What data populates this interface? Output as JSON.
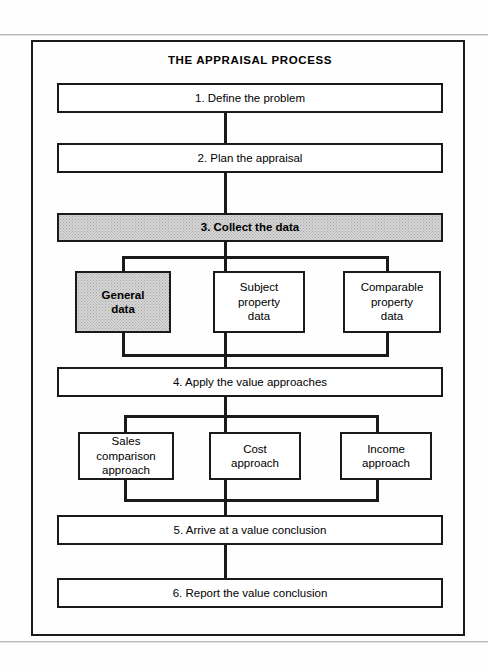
{
  "figure": {
    "title": "THE APPRAISAL PROCESS",
    "colors": {
      "ink": "#1a1a1a",
      "paper": "#fefefe",
      "highlight_fill": "#d5d5d5"
    }
  },
  "steps": [
    {
      "id": "step1",
      "label": "1. Define the problem",
      "highlighted": false
    },
    {
      "id": "step2",
      "label": "2.  Plan the appraisal",
      "highlighted": false
    },
    {
      "id": "step3",
      "label": "3.  Collect the data",
      "highlighted": true
    },
    {
      "id": "step4",
      "label": "4.  Apply the value approaches",
      "highlighted": false
    },
    {
      "id": "step5",
      "label": "5.  Arrive at a value conclusion",
      "highlighted": false
    },
    {
      "id": "step6",
      "label": "6.  Report the value conclusion",
      "highlighted": false
    }
  ],
  "data_branch": {
    "parent_step": "3.  Collect the data",
    "items": [
      {
        "id": "data-general",
        "label": "General\ndata",
        "highlighted": true
      },
      {
        "id": "data-subject",
        "label": "Subject\nproperty\ndata",
        "highlighted": false
      },
      {
        "id": "data-comparable",
        "label": "Comparable\nproperty\ndata",
        "highlighted": false
      }
    ]
  },
  "approach_branch": {
    "parent_step": "4.  Apply the value approaches",
    "items": [
      {
        "id": "approach-sales",
        "label": "Sales comparison\napproach",
        "highlighted": false
      },
      {
        "id": "approach-cost",
        "label": "Cost\napproach",
        "highlighted": false
      },
      {
        "id": "approach-income",
        "label": "Income\napproach",
        "highlighted": false
      }
    ]
  }
}
